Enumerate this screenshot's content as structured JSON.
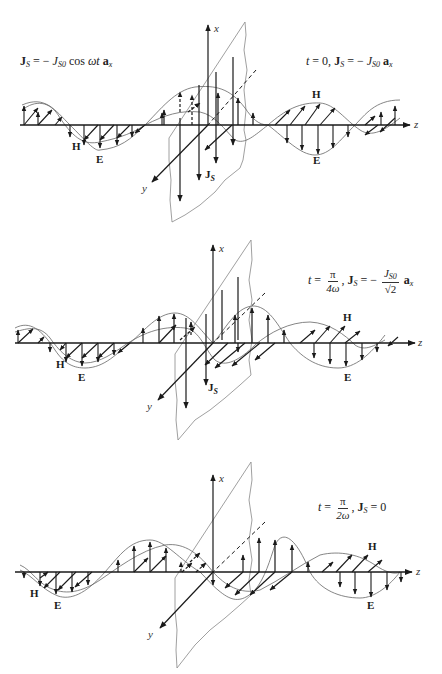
{
  "figure": {
    "colors": {
      "ink": "#1a1a1a",
      "curve": "#555555",
      "sheet": "#777777",
      "background": "#ffffff"
    },
    "axis_labels": {
      "x": "x",
      "y": "y",
      "z": "z"
    },
    "field_labels": {
      "H": "H",
      "E": "E",
      "Js": "J",
      "Js_sub": "S"
    },
    "source_equation": {
      "bold_J": "J",
      "sub_S": "S",
      "rhs_prefix": " = − ",
      "J": "J",
      "sub_S0": "S0",
      "cos": " cos ",
      "omega_t": "ωt",
      "a": " a",
      "sub_x": "x"
    },
    "panels": [
      {
        "id": "t0",
        "label": {
          "t": "t",
          "eq1": " = 0, ",
          "bold_J": "J",
          "sub_S": "S",
          "eq2": " = − ",
          "J": "J",
          "sub_S0": "S0",
          "a": " a",
          "sub_x": "x"
        },
        "axis_origin": [
          208,
          125
        ],
        "z_axis_y": 125
      },
      {
        "id": "t_pi_over_4omega",
        "label": {
          "t": "t",
          "eq1": " = ",
          "frac1_num": "π",
          "frac1_den": "4ω",
          "comma": ", ",
          "bold_J": "J",
          "sub_S": "S",
          "eq2": " = − ",
          "frac2_num": "J",
          "frac2_num_sub": "S0",
          "frac2_den": "√2",
          "a": " a",
          "sub_x": "x"
        },
        "axis_origin": [
          213,
          343
        ],
        "z_axis_y": 343
      },
      {
        "id": "t_pi_over_2omega",
        "label": {
          "t": "t",
          "eq1": " = ",
          "frac1_num": "π",
          "frac1_den": "2ω",
          "comma": ", ",
          "bold_J": "J",
          "sub_S": "S",
          "eq2": " = 0"
        },
        "axis_origin": [
          213,
          572
        ],
        "z_axis_y": 572
      }
    ]
  }
}
